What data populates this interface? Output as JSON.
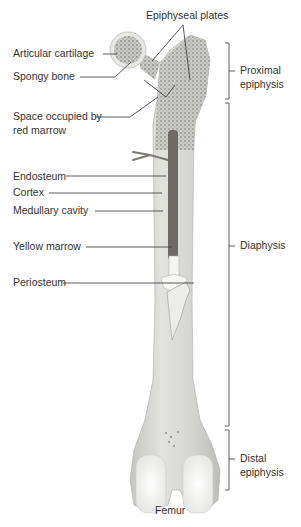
{
  "diagram": {
    "title": "Femur",
    "labels": {
      "epiphyseal_plates": "Epiphyseal plates",
      "articular_cartilage": "Articular cartilage",
      "spongy_bone": "Spongy bone",
      "red_marrow_line1": "Space occupied by",
      "red_marrow_line2": "red marrow",
      "endosteum": "Endosteum",
      "cortex": "Cortex",
      "medullary_cavity": "Medullary cavity",
      "yellow_marrow": "Yellow marrow",
      "periosteum": "Periosteum"
    },
    "regions": {
      "proximal_line1": "Proximal",
      "proximal_line2": "epiphysis",
      "diaphysis": "Diaphysis",
      "distal_line1": "Distal",
      "distal_line2": "epiphysis"
    },
    "colors": {
      "bone": "#d9d9d6",
      "bone_shade": "#bdbdb9",
      "spongy": "#a9a9a4",
      "marrow": "#6e6b66",
      "cartilage": "#f4f4f2",
      "line": "#333333"
    }
  }
}
